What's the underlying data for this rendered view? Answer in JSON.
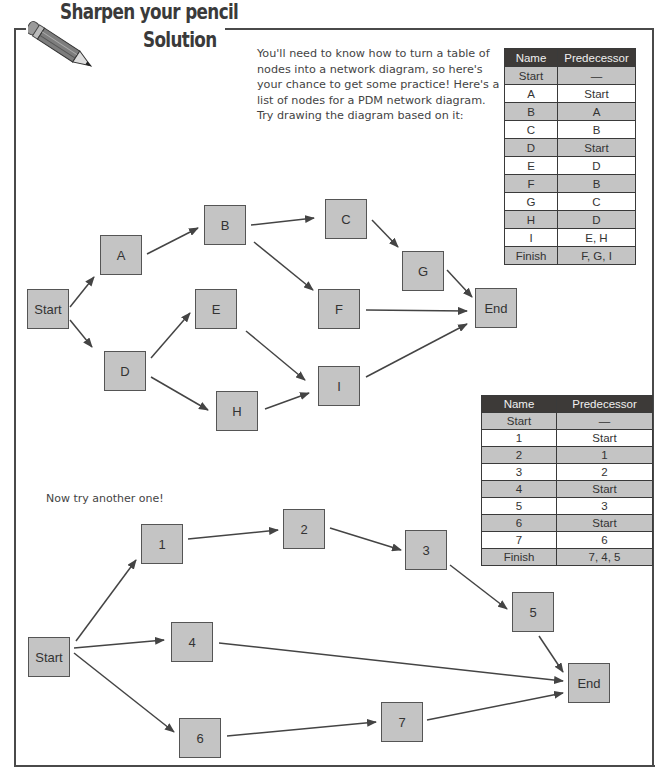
{
  "header": {
    "title_line1": "Sharpen your pencil",
    "title_line2": "Solution",
    "icon": "pencil-icon"
  },
  "intro": {
    "lines": [
      "You'll need to know how to turn a table of",
      "nodes into a network diagram, so here's",
      "your chance to get some practice! Here's a",
      "list of nodes for a PDM network diagram.",
      "Try drawing the diagram based on it:"
    ]
  },
  "table1": {
    "headers": [
      "Name",
      "Predecessor"
    ],
    "rows": [
      [
        "Start",
        "—"
      ],
      [
        "A",
        "Start"
      ],
      [
        "B",
        "A"
      ],
      [
        "C",
        "B"
      ],
      [
        "D",
        "Start"
      ],
      [
        "E",
        "D"
      ],
      [
        "F",
        "B"
      ],
      [
        "G",
        "C"
      ],
      [
        "H",
        "D"
      ],
      [
        "I",
        "E, H"
      ],
      [
        "Finish",
        "F, G, I"
      ]
    ]
  },
  "diagram1": {
    "nodes": [
      {
        "id": "Start",
        "label": "Start",
        "x": 27,
        "y": 289
      },
      {
        "id": "A",
        "label": "A",
        "x": 100,
        "y": 235
      },
      {
        "id": "B",
        "label": "B",
        "x": 204,
        "y": 205
      },
      {
        "id": "C",
        "label": "C",
        "x": 325,
        "y": 199
      },
      {
        "id": "D",
        "label": "D",
        "x": 104,
        "y": 351
      },
      {
        "id": "E",
        "label": "E",
        "x": 195,
        "y": 289
      },
      {
        "id": "F",
        "label": "F",
        "x": 318,
        "y": 289
      },
      {
        "id": "G",
        "label": "G",
        "x": 402,
        "y": 251
      },
      {
        "id": "H",
        "label": "H",
        "x": 216,
        "y": 391
      },
      {
        "id": "I",
        "label": "I",
        "x": 318,
        "y": 366
      },
      {
        "id": "End",
        "label": "End",
        "x": 475,
        "y": 288
      }
    ]
  },
  "another_prompt": "Now try another one!",
  "table2": {
    "headers": [
      "Name",
      "Predecessor"
    ],
    "rows": [
      [
        "Start",
        "—"
      ],
      [
        "1",
        "Start"
      ],
      [
        "2",
        "1"
      ],
      [
        "3",
        "2"
      ],
      [
        "4",
        "Start"
      ],
      [
        "5",
        "3"
      ],
      [
        "6",
        "Start"
      ],
      [
        "7",
        "6"
      ],
      [
        "Finish",
        "7, 4, 5"
      ]
    ]
  },
  "diagram2": {
    "nodes": [
      {
        "id": "Start",
        "label": "Start",
        "x": 28,
        "y": 637
      },
      {
        "id": "1",
        "label": "1",
        "x": 141,
        "y": 524
      },
      {
        "id": "2",
        "label": "2",
        "x": 283,
        "y": 509
      },
      {
        "id": "3",
        "label": "3",
        "x": 405,
        "y": 530
      },
      {
        "id": "4",
        "label": "4",
        "x": 171,
        "y": 622
      },
      {
        "id": "5",
        "label": "5",
        "x": 512,
        "y": 592
      },
      {
        "id": "6",
        "label": "6",
        "x": 179,
        "y": 718
      },
      {
        "id": "7",
        "label": "7",
        "x": 381,
        "y": 702
      },
      {
        "id": "End",
        "label": "End",
        "x": 568,
        "y": 663
      }
    ]
  },
  "colors": {
    "node_fill": "#c4c4c4",
    "node_border": "#555555",
    "table_header_bg": "#3d3a38",
    "table_shade": "#c4c4c4",
    "arrow": "#444444"
  }
}
